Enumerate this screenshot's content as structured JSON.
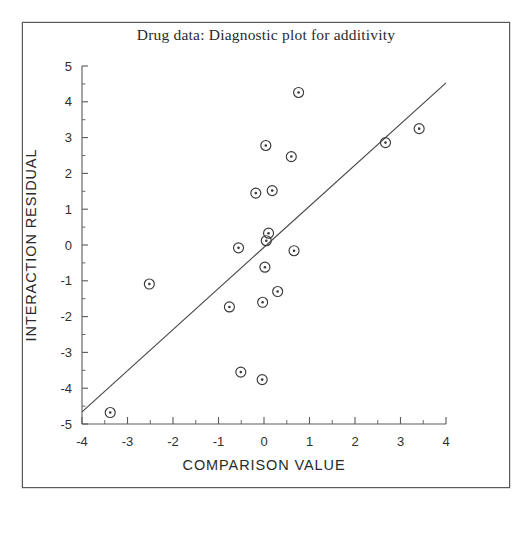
{
  "chart_data": {
    "type": "scatter",
    "title": "Drug data: Diagnostic plot for additivity",
    "xlabel": "COMPARISON VALUE",
    "ylabel": "INTERACTION RESIDUAL",
    "xlim": [
      -4,
      4
    ],
    "ylim": [
      -5,
      5
    ],
    "grid": false,
    "legend": null,
    "x_ticks": [
      -4,
      -3,
      -2,
      -1,
      0,
      1,
      2,
      3,
      4
    ],
    "x_tick_labels": [
      "-4",
      "-3",
      "-2",
      "-1",
      "0",
      "1",
      "2",
      "3",
      "4"
    ],
    "y_ticks": [
      -5,
      -4,
      -3,
      -2,
      -1,
      0,
      1,
      2,
      3,
      4,
      5
    ],
    "y_tick_labels": [
      "-5",
      "-4",
      "-3",
      "-2",
      "-1",
      "0",
      "1",
      "2",
      "3",
      "4",
      "5"
    ],
    "x_minor_ticks": [
      -3.5,
      -2.5,
      -1.5,
      -0.5,
      0.5,
      1.5,
      2.5,
      3.5
    ],
    "y_minor_ticks": [
      -4.5,
      -3.5,
      -2.5,
      -1.5,
      -0.5,
      0.5,
      1.5,
      2.5,
      3.5,
      4.5
    ],
    "marker": "circle-with-dot",
    "points": [
      {
        "x": 0.76,
        "y": 4.26
      },
      {
        "x": 3.41,
        "y": 3.25
      },
      {
        "x": 2.67,
        "y": 2.86
      },
      {
        "x": 0.04,
        "y": 2.78
      },
      {
        "x": 0.6,
        "y": 2.47
      },
      {
        "x": 0.18,
        "y": 1.52
      },
      {
        "x": -0.18,
        "y": 1.45
      },
      {
        "x": 0.1,
        "y": 0.33
      },
      {
        "x": 0.05,
        "y": 0.12
      },
      {
        "x": -0.56,
        "y": -0.08
      },
      {
        "x": 0.66,
        "y": -0.16
      },
      {
        "x": 0.02,
        "y": -0.62
      },
      {
        "x": -2.52,
        "y": -1.09
      },
      {
        "x": 0.3,
        "y": -1.3
      },
      {
        "x": -0.03,
        "y": -1.6
      },
      {
        "x": -0.76,
        "y": -1.73
      },
      {
        "x": -0.51,
        "y": -3.55
      },
      {
        "x": -0.04,
        "y": -3.76
      },
      {
        "x": -3.38,
        "y": -4.68
      }
    ],
    "reference_line": {
      "label": "fitted line",
      "x1": -4,
      "y1": -4.66,
      "x2": 4,
      "y2": 4.53
    }
  },
  "colors": {
    "marker": "#3a3a3a",
    "line": "#4a4a4a",
    "axis": "#5a5a5a",
    "frame": "#5a5a5a",
    "background": "#ffffff",
    "text": "#2a2a2a"
  }
}
